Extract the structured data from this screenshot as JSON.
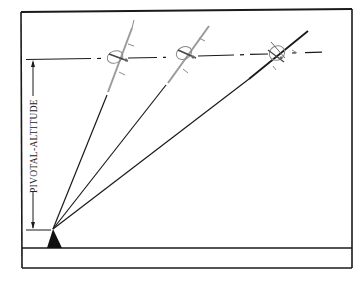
{
  "diagram": {
    "label": "PIVOTAL-ALTITUDE",
    "colors": {
      "ink": "#1a1a1a",
      "aircraft": "#8a8a8a",
      "background": "#ffffff"
    },
    "elements": {
      "frame": "outer-frame",
      "ground": "ground-line",
      "pivot": "pivot-point-triangle",
      "reference_line": "constant-altitude-dashed-line",
      "sight_lines": 3,
      "aircraft": 3,
      "dimension": "pivotal-altitude-arrow"
    }
  }
}
